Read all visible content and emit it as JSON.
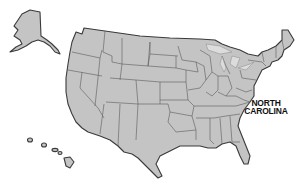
{
  "map": {
    "title": "United States",
    "highlighted_state": "North Carolina",
    "label": {
      "line1": "NORTH",
      "line2": "CAROLINA"
    },
    "colors": {
      "land": "#c4c4c4",
      "border": "#5a5a5a",
      "background": "#ffffff",
      "label": "#111111"
    },
    "insets": [
      "Alaska",
      "Hawaii"
    ]
  }
}
